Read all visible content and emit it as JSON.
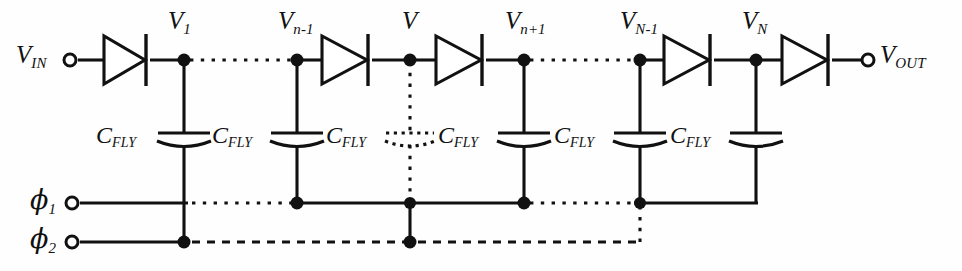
{
  "diagram": {
    "type": "circuit-schematic",
    "colors": {
      "line": "#111111",
      "background": "#fefefe",
      "fill": "#ffffff"
    }
  },
  "terminals": [
    {
      "id": "vin",
      "symbol": "V",
      "subscript": "IN",
      "x": 70,
      "y": 60,
      "label_x": 16,
      "label_y": 42
    },
    {
      "id": "vout",
      "symbol": "V",
      "subscript": "OUT",
      "x": 868,
      "y": 60,
      "label_x": 880,
      "label_y": 42
    },
    {
      "id": "phi1",
      "symbol": "ϕ",
      "subscript": "1",
      "x": 72,
      "y": 203,
      "label_x": 30,
      "label_y": 186
    },
    {
      "id": "phi2",
      "symbol": "ϕ",
      "subscript": "2",
      "x": 72,
      "y": 242,
      "label_x": 30,
      "label_y": 225
    }
  ],
  "nodes": [
    {
      "id": "v1",
      "symbol": "V",
      "subscript": "1",
      "x": 184,
      "y": 60,
      "label_x": 168,
      "label_y": 14,
      "dotted_drop": false
    },
    {
      "id": "vn-1",
      "symbol": "V",
      "subscript": "n-1",
      "x": 297,
      "y": 60,
      "label_x": 278,
      "label_y": 14,
      "dotted_drop": false
    },
    {
      "id": "vn",
      "symbol": "V",
      "subscript": "",
      "x": 410,
      "y": 60,
      "label_x": 402,
      "label_y": 14,
      "dotted_drop": true
    },
    {
      "id": "vn+1",
      "symbol": "V",
      "subscript": "n+1",
      "x": 524,
      "y": 60,
      "label_x": 505,
      "label_y": 14,
      "dotted_drop": false
    },
    {
      "id": "vN-1",
      "symbol": "V",
      "subscript": "N-1",
      "x": 640,
      "y": 60,
      "label_x": 620,
      "label_y": 14,
      "dotted_drop": false
    },
    {
      "id": "vN",
      "symbol": "V",
      "subscript": "N",
      "x": 756,
      "y": 60,
      "label_x": 742,
      "label_y": 14,
      "dotted_drop": false
    }
  ],
  "diodes": [
    {
      "id": "d1",
      "x_start": 104,
      "x_end": 150
    },
    {
      "id": "d2",
      "x_start": 322,
      "x_end": 372
    },
    {
      "id": "d3",
      "x_start": 436,
      "x_end": 486
    },
    {
      "id": "d4",
      "x_start": 664,
      "x_end": 714
    },
    {
      "id": "d5",
      "x_start": 782,
      "x_end": 832
    }
  ],
  "capacitors": [
    {
      "id": "c1",
      "x": 184,
      "label": {
        "symbol": "C",
        "subscript": "FLY"
      },
      "label_x": 96,
      "label_y": 123,
      "connects_to": "phi2",
      "dotted": false
    },
    {
      "id": "c2",
      "x": 297,
      "label": {
        "symbol": "C",
        "subscript": "FLY"
      },
      "label_x": 212,
      "label_y": 123,
      "connects_to": "phi1",
      "dotted": false
    },
    {
      "id": "c3",
      "x": 410,
      "label": {
        "symbol": "C",
        "subscript": "FLY"
      },
      "label_x": 326,
      "label_y": 123,
      "connects_to": "phi2",
      "dotted": true
    },
    {
      "id": "c4",
      "x": 524,
      "label": {
        "symbol": "C",
        "subscript": "FLY"
      },
      "label_x": 438,
      "label_y": 123,
      "connects_to": "phi1",
      "dotted": false
    },
    {
      "id": "c5",
      "x": 640,
      "label": {
        "symbol": "C",
        "subscript": "FLY"
      },
      "label_x": 554,
      "label_y": 123,
      "connects_to": "phi1",
      "dotted": false
    },
    {
      "id": "c6",
      "x": 756,
      "label": {
        "symbol": "C",
        "subscript": "FLY"
      },
      "label_x": 670,
      "label_y": 123,
      "connects_to": "phi1",
      "dotted": false
    }
  ],
  "rail": {
    "y": 60,
    "x_start": 78,
    "x_end": 862
  },
  "phase_lines": {
    "phi1": {
      "y": 203,
      "x_start": 80,
      "x_end": 756
    },
    "phi2": {
      "y": 242,
      "x_start": 80,
      "x_end": 640
    }
  },
  "ellipsis_segments": [
    {
      "id": "rail-gap-1",
      "y": 60,
      "x_start": 184,
      "x_end": 297,
      "style": "dotted"
    },
    {
      "id": "rail-gap-2",
      "y": 60,
      "x_start": 524,
      "x_end": 640,
      "style": "dotted"
    },
    {
      "id": "phi1-gap-1",
      "y": 203,
      "x_start": 184,
      "x_end": 297,
      "style": "dotted"
    },
    {
      "id": "phi1-gap-2",
      "y": 203,
      "x_start": 524,
      "x_end": 640,
      "style": "dotted"
    },
    {
      "id": "phi2-gap-1",
      "y": 242,
      "x_start": 184,
      "x_end": 410,
      "style": "dotted"
    },
    {
      "id": "phi2-gap-2",
      "y": 242,
      "x_start": 410,
      "x_end": 640,
      "style": "dotted"
    }
  ]
}
